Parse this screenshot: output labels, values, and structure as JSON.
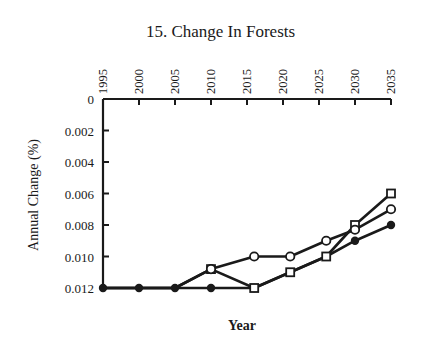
{
  "chart_data": {
    "type": "line",
    "title": "15. Change In Forests",
    "xlabel": "Year",
    "ylabel": "Annual Change (%)",
    "x_ticks": [
      "1995",
      "2000",
      "2005",
      "2010",
      "2015",
      "2020",
      "2025",
      "2030",
      "2035"
    ],
    "y_ticks": [
      "0",
      "0.002",
      "0.004",
      "0.006",
      "0.008",
      "0.010",
      "0.012"
    ],
    "xlim": [
      1995,
      2035
    ],
    "ylim": [
      0.012,
      0
    ],
    "y_inverted": true,
    "x_axis_position": "top",
    "grid": false,
    "legend": null,
    "series": [
      {
        "name": "open-circle",
        "marker": "open-circle",
        "x": [
          1995,
          2000,
          2005,
          2010,
          2016,
          2021,
          2026,
          2030,
          2035
        ],
        "values": [
          0.012,
          0.012,
          0.012,
          0.0108,
          0.01,
          0.01,
          0.009,
          0.0083,
          0.007
        ]
      },
      {
        "name": "open-square",
        "marker": "open-square",
        "x": [
          1995,
          2000,
          2005,
          2010,
          2016,
          2021,
          2026,
          2030,
          2035
        ],
        "values": [
          0.012,
          0.012,
          0.012,
          0.0108,
          0.012,
          0.011,
          0.01,
          0.008,
          0.006
        ]
      },
      {
        "name": "filled-circle",
        "marker": "filled-circle",
        "x": [
          1995,
          2000,
          2005,
          2010,
          2016,
          2021,
          2026,
          2030,
          2035
        ],
        "values": [
          0.012,
          0.012,
          0.012,
          0.012,
          0.012,
          0.011,
          0.01,
          0.009,
          0.008
        ]
      }
    ]
  }
}
